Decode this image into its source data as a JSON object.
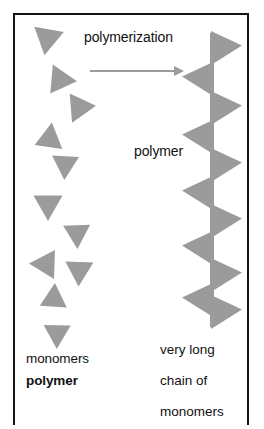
{
  "figure": {
    "border_color": "#141414",
    "background_color": "#ffffff",
    "shape_color": "#9b9b9b",
    "arrow_color": "#9b9b9b",
    "text_color": "#111111"
  },
  "labels": {
    "polymerization": "polymerization",
    "polymer_mid": "polymer",
    "monomers": "monomers",
    "polymer_bold": "polymer",
    "chain_line1": "very long",
    "chain_line2": "chain of",
    "chain_line3": "monomers"
  },
  "arrow": {
    "name": "polymerization-arrow",
    "direction": "right",
    "x1": 90,
    "y1": 71,
    "x2": 184,
    "y2": 71,
    "color": "#9b9b9b"
  },
  "diagram_data": {
    "type": "schematic",
    "shape_color": "#9b9b9b",
    "monomers": [
      {
        "name": "monomer-1",
        "cx": 47,
        "cy": 41,
        "size": 30,
        "rotation": 190
      },
      {
        "name": "monomer-2",
        "cx": 63,
        "cy": 80,
        "size": 29,
        "rotation": 95
      },
      {
        "name": "monomer-3",
        "cx": 78,
        "cy": 110,
        "size": 29,
        "rotation": 205
      },
      {
        "name": "monomer-4",
        "cx": 50,
        "cy": 136,
        "size": 28,
        "rotation": 8
      },
      {
        "name": "monomer-5",
        "cx": 65,
        "cy": 167,
        "size": 27,
        "rotation": 183
      },
      {
        "name": "monomer-6",
        "cx": 48,
        "cy": 207,
        "size": 29,
        "rotation": 180
      },
      {
        "name": "monomer-7",
        "cx": 77,
        "cy": 236,
        "size": 27,
        "rotation": 178
      },
      {
        "name": "monomer-8",
        "cx": 43,
        "cy": 264,
        "size": 29,
        "rotation": 272
      },
      {
        "name": "monomer-9",
        "cx": 79,
        "cy": 273,
        "size": 28,
        "rotation": 182
      },
      {
        "name": "monomer-10",
        "cx": 54,
        "cy": 296,
        "size": 27,
        "rotation": 4
      },
      {
        "name": "monomer-11",
        "cx": 57,
        "cy": 336,
        "size": 27,
        "rotation": 181
      }
    ],
    "chain_axis_x": 212,
    "chain_segments": [
      {
        "name": "chain-unit-1",
        "cy": 48,
        "direction": "right"
      },
      {
        "name": "chain-unit-2",
        "cy": 79,
        "direction": "left"
      },
      {
        "name": "chain-unit-3",
        "cy": 108,
        "direction": "right"
      },
      {
        "name": "chain-unit-4",
        "cy": 137,
        "direction": "left"
      },
      {
        "name": "chain-unit-5",
        "cy": 165,
        "direction": "right"
      },
      {
        "name": "chain-unit-6",
        "cy": 193,
        "direction": "left"
      },
      {
        "name": "chain-unit-7",
        "cy": 221,
        "direction": "right"
      },
      {
        "name": "chain-unit-8",
        "cy": 248,
        "direction": "left"
      },
      {
        "name": "chain-unit-9",
        "cy": 275,
        "direction": "right"
      },
      {
        "name": "chain-unit-10",
        "cy": 300,
        "direction": "left"
      },
      {
        "name": "chain-unit-11",
        "cy": 312,
        "direction": "right"
      }
    ]
  }
}
